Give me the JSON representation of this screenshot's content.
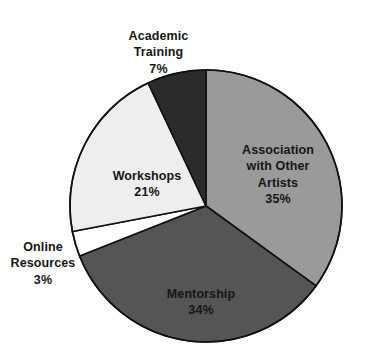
{
  "chart_data": {
    "type": "pie",
    "title": "",
    "subtitle": "",
    "xlabel": "",
    "ylabel": "",
    "legend_position": "none",
    "grid": false,
    "labels_inside": true,
    "start_angle_deg": 0,
    "direction": "clockwise",
    "categories": [
      "Association with Other Artists",
      "Mentorship",
      "Online Resources",
      "Workshops",
      "Academic Training"
    ],
    "values": [
      35,
      34,
      3,
      21,
      7
    ],
    "unit": "%",
    "slices": [
      {
        "name": "Association with Other Artists",
        "label": "Association\nwith Other\nArtists",
        "value": 35,
        "value_label": "35%",
        "color": "#9a9a9a",
        "label_placement": "inside"
      },
      {
        "name": "Mentorship",
        "label": "Mentorship",
        "value": 34,
        "value_label": "34%",
        "color": "#555555",
        "label_placement": "inside"
      },
      {
        "name": "Online Resources",
        "label": "Online\nResources",
        "value": 3,
        "value_label": "3%",
        "color": "#ffffff",
        "label_placement": "outside"
      },
      {
        "name": "Workshops",
        "label": "Workshops",
        "value": 21,
        "value_label": "21%",
        "color": "#eeeeee",
        "label_placement": "inside"
      },
      {
        "name": "Academic Training",
        "label": "Academic\nTraining",
        "value": 7,
        "value_label": "7%",
        "color": "#2b2b2b",
        "label_placement": "outside"
      }
    ],
    "geometry": {
      "center_x": 206,
      "center_y": 206,
      "radius": 136,
      "outline_color": "#111111",
      "outline_width": 1.6,
      "background": "#ffffff"
    }
  }
}
